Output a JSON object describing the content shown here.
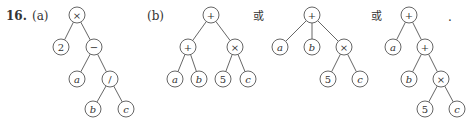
{
  "problem": {
    "number": "16.",
    "part_a_label": "(a)",
    "part_b_label": "(b)",
    "or_text_1": "或",
    "or_text_2": "或",
    "end_period": "."
  },
  "trees": [
    {
      "id": "a",
      "nodes": [
        {
          "id": "n0",
          "label": "×",
          "x": 77,
          "y": 15,
          "italic": false
        },
        {
          "id": "n1",
          "label": "2",
          "x": 61,
          "y": 47,
          "italic": false
        },
        {
          "id": "n2",
          "label": "−",
          "x": 94,
          "y": 47,
          "italic": false
        },
        {
          "id": "n3",
          "label": "a",
          "x": 77,
          "y": 79,
          "italic": true
        },
        {
          "id": "n4",
          "label": "/",
          "x": 110,
          "y": 79,
          "italic": false
        },
        {
          "id": "n5",
          "label": "b",
          "x": 93,
          "y": 109,
          "italic": true
        },
        {
          "id": "n6",
          "label": "c",
          "x": 126,
          "y": 109,
          "italic": true
        }
      ],
      "edges": [
        [
          "n0",
          "n1"
        ],
        [
          "n0",
          "n2"
        ],
        [
          "n2",
          "n3"
        ],
        [
          "n2",
          "n4"
        ],
        [
          "n4",
          "n5"
        ],
        [
          "n4",
          "n6"
        ]
      ]
    },
    {
      "id": "b1",
      "nodes": [
        {
          "id": "n0",
          "label": "+",
          "x": 211,
          "y": 15,
          "italic": false
        },
        {
          "id": "n1",
          "label": "+",
          "x": 188,
          "y": 47,
          "italic": false
        },
        {
          "id": "n2",
          "label": "×",
          "x": 235,
          "y": 47,
          "italic": false
        },
        {
          "id": "n3",
          "label": "a",
          "x": 175,
          "y": 79,
          "italic": true
        },
        {
          "id": "n4",
          "label": "b",
          "x": 199,
          "y": 79,
          "italic": true
        },
        {
          "id": "n5",
          "label": "5",
          "x": 223,
          "y": 79,
          "italic": false
        },
        {
          "id": "n6",
          "label": "c",
          "x": 248,
          "y": 79,
          "italic": true
        }
      ],
      "edges": [
        [
          "n0",
          "n1"
        ],
        [
          "n0",
          "n2"
        ],
        [
          "n1",
          "n3"
        ],
        [
          "n1",
          "n4"
        ],
        [
          "n2",
          "n5"
        ],
        [
          "n2",
          "n6"
        ]
      ]
    },
    {
      "id": "b2",
      "nodes": [
        {
          "id": "n0",
          "label": "+",
          "x": 312,
          "y": 15,
          "italic": false
        },
        {
          "id": "n1",
          "label": "a",
          "x": 280,
          "y": 47,
          "italic": true
        },
        {
          "id": "n2",
          "label": "b",
          "x": 312,
          "y": 47,
          "italic": true
        },
        {
          "id": "n3",
          "label": "×",
          "x": 344,
          "y": 47,
          "italic": false
        },
        {
          "id": "n4",
          "label": "5",
          "x": 328,
          "y": 79,
          "italic": false
        },
        {
          "id": "n5",
          "label": "c",
          "x": 360,
          "y": 79,
          "italic": true
        }
      ],
      "edges": [
        [
          "n0",
          "n1"
        ],
        [
          "n0",
          "n2"
        ],
        [
          "n0",
          "n3"
        ],
        [
          "n3",
          "n4"
        ],
        [
          "n3",
          "n5"
        ]
      ]
    },
    {
      "id": "b3",
      "nodes": [
        {
          "id": "n0",
          "label": "+",
          "x": 409,
          "y": 15,
          "italic": false
        },
        {
          "id": "n1",
          "label": "a",
          "x": 393,
          "y": 47,
          "italic": true
        },
        {
          "id": "n2",
          "label": "+",
          "x": 425,
          "y": 47,
          "italic": false
        },
        {
          "id": "n3",
          "label": "b",
          "x": 409,
          "y": 79,
          "italic": true
        },
        {
          "id": "n4",
          "label": "×",
          "x": 441,
          "y": 79,
          "italic": false
        },
        {
          "id": "n5",
          "label": "5",
          "x": 425,
          "y": 109,
          "italic": false
        },
        {
          "id": "n6",
          "label": "c",
          "x": 457,
          "y": 109,
          "italic": true
        }
      ],
      "edges": [
        [
          "n0",
          "n1"
        ],
        [
          "n0",
          "n2"
        ],
        [
          "n2",
          "n3"
        ],
        [
          "n2",
          "n4"
        ],
        [
          "n4",
          "n5"
        ],
        [
          "n4",
          "n6"
        ]
      ]
    }
  ],
  "style": {
    "node_radius": 8,
    "stroke_color": "#555555",
    "text_color": "#333333"
  }
}
